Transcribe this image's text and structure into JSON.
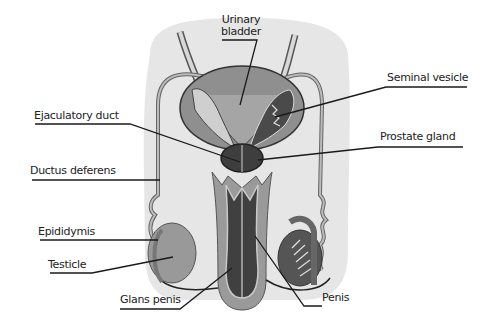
{
  "diagram": {
    "colors": {
      "background": "#ffffff",
      "body_fill": "#e6e6e6",
      "light_tissue": "#c9c9c9",
      "mid_tissue": "#8f8f8f",
      "dark_tissue": "#4a4a4a",
      "outline": "#2a2a2a",
      "leader_line": "#1a1a1a"
    },
    "labels": [
      {
        "id": "urinary-bladder",
        "text_lines": [
          "Urinary",
          "bladder"
        ]
      },
      {
        "id": "seminal-vesicle",
        "text": "Seminal vesicle"
      },
      {
        "id": "ejaculatory-duct",
        "text": "Ejaculatory duct"
      },
      {
        "id": "prostate-gland",
        "text": "Prostate gland"
      },
      {
        "id": "ductus-deferens",
        "text": "Ductus deferens"
      },
      {
        "id": "epididymis",
        "text": "Epididymis"
      },
      {
        "id": "testicle",
        "text": "Testicle"
      },
      {
        "id": "glans-penis",
        "text": "Glans penis"
      },
      {
        "id": "penis",
        "text": "Penis"
      }
    ]
  }
}
